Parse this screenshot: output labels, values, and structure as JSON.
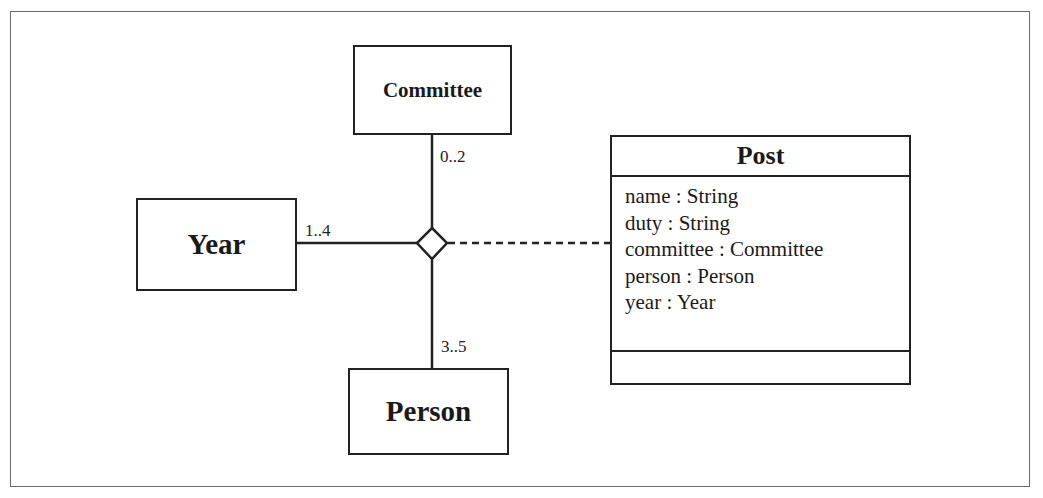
{
  "diagram": {
    "type": "UML class diagram with n-ary association and association class",
    "classes": {
      "committee": {
        "name": "Committee"
      },
      "year": {
        "name": "Year"
      },
      "person": {
        "name": "Person"
      }
    },
    "association": {
      "kind": "ternary (diamond)",
      "ends": [
        {
          "class": "Committee",
          "multiplicity": "0..2"
        },
        {
          "class": "Year",
          "multiplicity": "1..4"
        },
        {
          "class": "Person",
          "multiplicity": "3..5"
        }
      ]
    },
    "association_class": {
      "name": "Post",
      "attributes": [
        "name : String",
        "duty : String",
        "committee : Committee",
        "person : Person",
        "year : Year"
      ],
      "operations": []
    }
  }
}
